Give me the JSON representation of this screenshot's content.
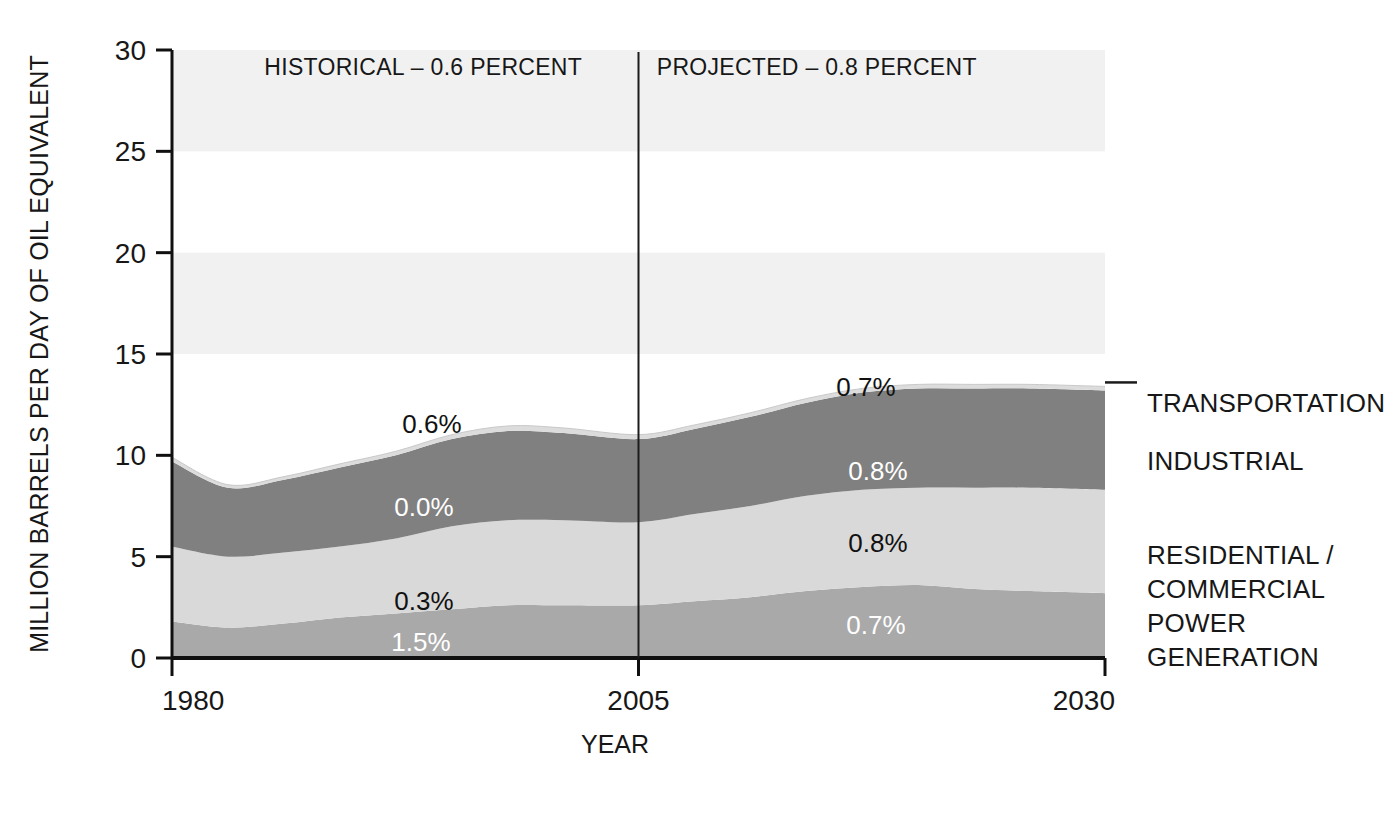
{
  "chart_data": {
    "type": "area",
    "title": "",
    "subtitle": "",
    "xlabel": "YEAR",
    "ylabel": "MILLION BARRELS PER DAY OF OIL EQUIVALENT",
    "xlim": [
      1980,
      2030
    ],
    "ylim": [
      0,
      30
    ],
    "grid": false,
    "stacked": true,
    "legend_position": "right",
    "y_ticks": [
      "30",
      "25",
      "20",
      "15",
      "10",
      "5",
      "0"
    ],
    "y_tick_values": [
      30,
      25,
      20,
      15,
      10,
      5,
      0
    ],
    "x_ticks": [
      "1980",
      "2005",
      "2030"
    ],
    "x_tick_values": [
      1980,
      2005,
      2030
    ],
    "x": [
      1980,
      1983,
      1986,
      1989,
      1992,
      1995,
      1998,
      2001,
      2005,
      2008,
      2011,
      2014,
      2017,
      2020,
      2023,
      2026,
      2030
    ],
    "series": [
      {
        "name": "POWER GENERATION",
        "color": "#a9a9a9",
        "values": [
          1.8,
          1.5,
          1.7,
          2.0,
          2.2,
          2.4,
          2.6,
          2.6,
          2.6,
          2.8,
          3.0,
          3.3,
          3.5,
          3.6,
          3.4,
          3.3,
          3.2
        ],
        "growth_historical": "1.5%",
        "growth_projected": "0.7%"
      },
      {
        "name": "RESIDENTIAL / COMMERCIAL",
        "color": "#d9d9d9",
        "values": [
          3.7,
          3.5,
          3.5,
          3.5,
          3.7,
          4.1,
          4.2,
          4.2,
          4.1,
          4.3,
          4.5,
          4.7,
          4.8,
          4.8,
          5.0,
          5.1,
          5.1
        ],
        "growth_historical": "0.3%",
        "growth_projected": "0.8%"
      },
      {
        "name": "INDUSTRIAL",
        "color": "#808080",
        "values": [
          4.2,
          3.4,
          3.6,
          3.9,
          4.1,
          4.3,
          4.4,
          4.3,
          4.1,
          4.2,
          4.4,
          4.6,
          4.8,
          4.9,
          4.9,
          4.9,
          4.9
        ],
        "growth_historical": "0.0%",
        "growth_projected": "0.8%"
      },
      {
        "name": "TRANSPORTATION",
        "color": "#dcdcdc",
        "values": [
          0.2,
          0.15,
          0.15,
          0.18,
          0.2,
          0.22,
          0.25,
          0.25,
          0.22,
          0.2,
          0.2,
          0.2,
          0.2,
          0.2,
          0.2,
          0.2,
          0.2
        ],
        "growth_historical": "0.6%",
        "growth_projected": "0.7%"
      }
    ],
    "annotations": {
      "period_divider_year": 2005,
      "historical_label": "HISTORICAL – 0.6 PERCENT",
      "projected_label": "PROJECTED – 0.8 PERCENT",
      "historical_rate": "0.6",
      "projected_rate": "0.8"
    },
    "inline_labels": {
      "historical": [
        {
          "text": "0.6%",
          "series": "TRANSPORTATION",
          "color": "dark"
        },
        {
          "text": "0.0%",
          "series": "INDUSTRIAL",
          "color": "light"
        },
        {
          "text": "0.3%",
          "series": "RESIDENTIAL / COMMERCIAL",
          "color": "dark"
        },
        {
          "text": "1.5%",
          "series": "POWER GENERATION",
          "color": "light"
        }
      ],
      "projected": [
        {
          "text": "0.7%",
          "series": "TRANSPORTATION",
          "color": "dark"
        },
        {
          "text": "0.8%",
          "series": "INDUSTRIAL",
          "color": "light"
        },
        {
          "text": "0.8%",
          "series": "RESIDENTIAL / COMMERCIAL",
          "color": "dark"
        },
        {
          "text": "0.7%",
          "series": "POWER GENERATION",
          "color": "light"
        }
      ]
    },
    "legend_entries": [
      {
        "label": "TRANSPORTATION",
        "color": "#dcdcdc",
        "has_leader": true
      },
      {
        "label": "INDUSTRIAL",
        "color": "#808080",
        "has_leader": false
      },
      {
        "label": "RESIDENTIAL /",
        "label2": "COMMERCIAL",
        "color": "#d9d9d9",
        "has_leader": false
      },
      {
        "label": "POWER",
        "label2": "GENERATION",
        "color": "#a9a9a9",
        "has_leader": false
      }
    ],
    "background_bands": [
      {
        "from": 25,
        "to": 30
      },
      {
        "from": 15,
        "to": 20
      }
    ],
    "colors": {
      "axis": "#101010",
      "text": "#171717",
      "band_shade": "#f1f1f1"
    }
  }
}
